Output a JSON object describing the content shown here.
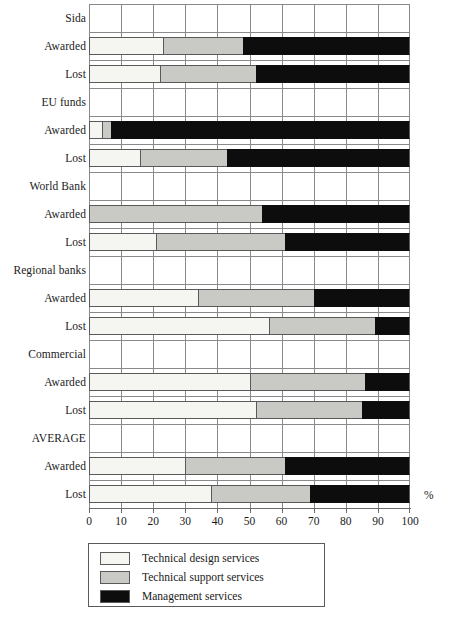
{
  "chart_data": {
    "type": "bar",
    "orientation": "horizontal",
    "stacked": true,
    "stacked_percent": true,
    "title": "",
    "subtitle": "",
    "xlabel": "%",
    "ylabel": "",
    "xlim": [
      0,
      100
    ],
    "xticks": [
      0,
      10,
      20,
      30,
      40,
      50,
      60,
      70,
      80,
      90,
      100
    ],
    "xticklabels": [
      "0",
      "10",
      "20",
      "30",
      "40",
      "50",
      "60",
      "70",
      "80",
      "90",
      "100"
    ],
    "grid": "vertical",
    "legend_position": "bottom-left",
    "series": [
      {
        "name": "Technical design services",
        "color": "#f5f5f1",
        "values": [
          23,
          22,
          4,
          16,
          0,
          21,
          34,
          56,
          50,
          52,
          30,
          38
        ]
      },
      {
        "name": "Technical support services",
        "color": "#c9c9c5",
        "values": [
          25,
          30,
          3,
          27,
          54,
          40,
          36,
          33,
          36,
          33,
          31,
          31
        ]
      },
      {
        "name": "Management services",
        "color": "#0d0d0d",
        "values": [
          52,
          48,
          93,
          57,
          46,
          39,
          30,
          11,
          14,
          15,
          39,
          31
        ]
      }
    ],
    "groups": [
      {
        "label": "Sida",
        "rows": [
          {
            "label": "Awarded",
            "design": 23,
            "support": 25,
            "management": 52
          },
          {
            "label": "Lost",
            "design": 22,
            "support": 30,
            "management": 48
          }
        ]
      },
      {
        "label": "EU funds",
        "rows": [
          {
            "label": "Awarded",
            "design": 4,
            "support": 3,
            "management": 93
          },
          {
            "label": "Lost",
            "design": 16,
            "support": 27,
            "management": 57
          }
        ]
      },
      {
        "label": "World Bank",
        "rows": [
          {
            "label": "Awarded",
            "design": 0,
            "support": 54,
            "management": 46
          },
          {
            "label": "Lost",
            "design": 21,
            "support": 40,
            "management": 39
          }
        ]
      },
      {
        "label": "Regional banks",
        "rows": [
          {
            "label": "Awarded",
            "design": 34,
            "support": 36,
            "management": 30
          },
          {
            "label": "Lost",
            "design": 56,
            "support": 33,
            "management": 11
          }
        ]
      },
      {
        "label": "Commercial",
        "rows": [
          {
            "label": "Awarded",
            "design": 50,
            "support": 36,
            "management": 14
          },
          {
            "label": "Lost",
            "design": 52,
            "support": 33,
            "management": 15
          }
        ]
      },
      {
        "label": "AVERAGE",
        "rows": [
          {
            "label": "Awarded",
            "design": 30,
            "support": 31,
            "management": 39
          },
          {
            "label": "Lost",
            "design": 38,
            "support": 31,
            "management": 31
          }
        ]
      }
    ],
    "legend": [
      {
        "label": "Technical design services",
        "color": "#f5f5f1"
      },
      {
        "label": "Technical support services",
        "color": "#c9c9c5"
      },
      {
        "label": "Management services",
        "color": "#0d0d0d"
      }
    ]
  }
}
